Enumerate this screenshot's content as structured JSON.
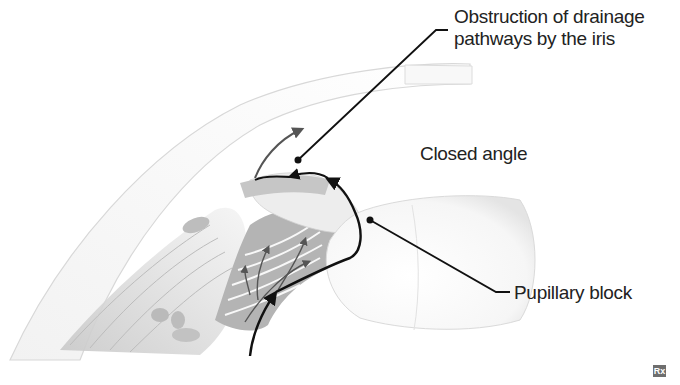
{
  "diagram": {
    "labels": {
      "obstruction_line1": "Obstruction of drainage",
      "obstruction_line2": "pathways by the iris",
      "closed_angle": "Closed angle",
      "pupillary_block": "Pupillary block"
    },
    "logo_text": "Rx",
    "colors": {
      "background": "#ffffff",
      "tissue_light": "#ececec",
      "tissue_mid": "#cfcfcf",
      "tissue_dark": "#9a9a9a",
      "outline": "#d6d6d6",
      "leader_line": "#111111",
      "flow_arrow": "#555555",
      "text": "#222222"
    }
  }
}
